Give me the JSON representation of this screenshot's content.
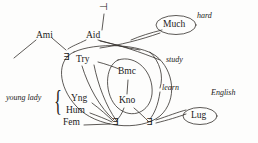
{
  "diagram": {
    "stroke_color": "#33302c",
    "text_color": "#1a1a1a",
    "background": "#fdfdfc",
    "nodes": [
      {
        "id": "ami",
        "label": "Ami",
        "x": 38,
        "y": 36,
        "shape": "none"
      },
      {
        "id": "aid",
        "label": "Aid",
        "x": 88,
        "y": 36,
        "shape": "none"
      },
      {
        "id": "try",
        "label": "Try",
        "x": 80,
        "y": 60,
        "shape": "none"
      },
      {
        "id": "bmc",
        "label": "Bmc",
        "x": 122,
        "y": 72,
        "shape": "none"
      },
      {
        "id": "kno",
        "label": "Kno",
        "x": 124,
        "y": 101,
        "shape": "none"
      },
      {
        "id": "yng",
        "label": "Yng",
        "x": 74,
        "y": 99,
        "shape": "none"
      },
      {
        "id": "hum",
        "label": "Hum",
        "x": 69,
        "y": 111,
        "shape": "none"
      },
      {
        "id": "fem",
        "label": "Fem",
        "x": 66,
        "y": 123,
        "shape": "none"
      },
      {
        "id": "much",
        "label": "Much",
        "x": 176,
        "y": 25,
        "shape": "ellipse"
      },
      {
        "id": "lug",
        "label": "Lug",
        "x": 199,
        "y": 116,
        "shape": "ellipse"
      }
    ],
    "edge_labels": [
      {
        "id": "hard",
        "label": "hard",
        "x": 199,
        "y": 16
      },
      {
        "id": "study",
        "label": "study",
        "x": 168,
        "y": 60
      },
      {
        "id": "learn",
        "label": "learn",
        "x": 164,
        "y": 88
      },
      {
        "id": "english",
        "label": "English",
        "x": 214,
        "y": 93
      }
    ],
    "group_labels": [
      {
        "id": "young-lady",
        "label": "young lady",
        "x": 8,
        "y": 97
      }
    ],
    "quantifiers": [
      {
        "id": "quant-try",
        "symbol": "∃",
        "x": 65,
        "y": 57
      },
      {
        "id": "quant-fem",
        "symbol": "∃",
        "x": 114,
        "y": 122
      },
      {
        "id": "quant-kno",
        "symbol": "∃",
        "x": 148,
        "y": 122
      }
    ],
    "operators": [
      {
        "id": "turnstile-top",
        "symbol": "⊣",
        "x": 101,
        "y": 5
      }
    ]
  }
}
